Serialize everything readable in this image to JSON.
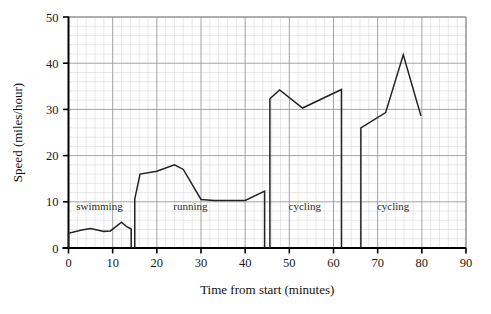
{
  "chart_data": {
    "type": "line",
    "title": "",
    "xlabel": "Time from start (minutes)",
    "ylabel": "Speed (miles/hour)",
    "xlim": [
      0,
      90
    ],
    "ylim": [
      0,
      50
    ],
    "xticks": [
      0,
      10,
      20,
      30,
      40,
      50,
      60,
      70,
      80,
      90
    ],
    "yticks": [
      0,
      10,
      20,
      30,
      40,
      50
    ],
    "xtick_labels": [
      "0",
      "10",
      "20",
      "30",
      "40",
      "50",
      "60",
      "70",
      "80",
      "90"
    ],
    "ytick_labels": [
      "0",
      "10",
      "20",
      "30",
      "40",
      "50"
    ],
    "grid": true,
    "grid_major_step_x": 10,
    "grid_major_step_y": 10,
    "grid_minor_step_x": 2,
    "grid_minor_step_y": 2,
    "legend": "none",
    "line_color": "#222222",
    "grid_major_color": "#9a9a9a",
    "grid_minor_color": "#d8d8d8",
    "axis_color": "#000000",
    "series": [
      {
        "name": "swimming",
        "points": [
          [
            0.0,
            0.0
          ],
          [
            0.0,
            3.2
          ],
          [
            3.0,
            3.9
          ],
          [
            5.0,
            4.2
          ],
          [
            8.0,
            3.6
          ],
          [
            9.5,
            3.7
          ],
          [
            12.0,
            5.6
          ],
          [
            13.2,
            4.6
          ],
          [
            14.2,
            4.1
          ],
          [
            14.2,
            0.0
          ]
        ]
      },
      {
        "name": "running",
        "points": [
          [
            15.0,
            0.0
          ],
          [
            15.0,
            10.6
          ],
          [
            16.2,
            16.0
          ],
          [
            20.0,
            16.6
          ],
          [
            24.0,
            18.0
          ],
          [
            26.0,
            17.0
          ],
          [
            30.0,
            10.5
          ],
          [
            33.0,
            10.3
          ],
          [
            40.0,
            10.3
          ],
          [
            44.4,
            12.3
          ],
          [
            44.4,
            0.0
          ]
        ]
      },
      {
        "name": "cycling",
        "points": [
          [
            45.6,
            0.0
          ],
          [
            45.6,
            32.3
          ],
          [
            47.8,
            34.2
          ],
          [
            53.0,
            30.3
          ],
          [
            61.8,
            34.3
          ],
          [
            61.8,
            0.0
          ]
        ]
      },
      {
        "name": "cycling",
        "points": [
          [
            66.2,
            0.0
          ],
          [
            66.2,
            26.0
          ],
          [
            71.8,
            29.3
          ],
          [
            75.8,
            41.8
          ],
          [
            79.8,
            28.6
          ]
        ]
      }
    ],
    "annotations": [
      {
        "text": "swimming",
        "x": 7.0,
        "y": 8.2
      },
      {
        "text": "running",
        "x": 27.6,
        "y": 8.2
      },
      {
        "text": "cycling",
        "x": 53.5,
        "y": 8.2
      },
      {
        "text": "cycling",
        "x": 73.5,
        "y": 8.2
      }
    ]
  }
}
